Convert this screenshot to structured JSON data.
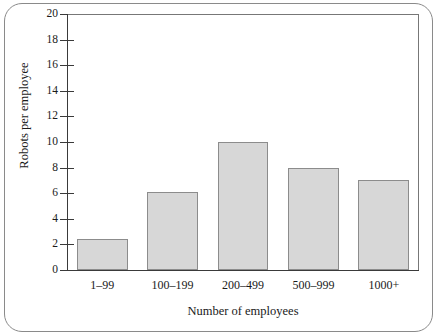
{
  "chart_data": {
    "type": "bar",
    "title": "",
    "subtitle": "",
    "xlabel": "Number of employees",
    "ylabel": "Robots per employee",
    "categories": [
      "1–99",
      "100–199",
      "200–499",
      "500–999",
      "1000+"
    ],
    "values": [
      2.4,
      6.1,
      10.0,
      8.0,
      7.0
    ],
    "ylim": [
      0,
      20
    ],
    "yticks": [
      0,
      2,
      4,
      6,
      8,
      10,
      12,
      14,
      16,
      18,
      20
    ],
    "ytick_labels": [
      "0",
      "2",
      "4",
      "6",
      "8",
      "10",
      "12",
      "14",
      "16",
      "18",
      "20"
    ],
    "grid": false,
    "legend": null,
    "series": [
      {
        "name": "Robots per employee",
        "values": [
          2.4,
          6.1,
          10.0,
          8.0,
          7.0
        ]
      }
    ],
    "colors": {
      "bar_fill": "#d7d7d7",
      "bar_edge": "#8c8c8c",
      "axis": "#3a3a3a",
      "frame": "#8a8a8a",
      "background": "#ffffff",
      "text": "#1a1a1a"
    }
  }
}
